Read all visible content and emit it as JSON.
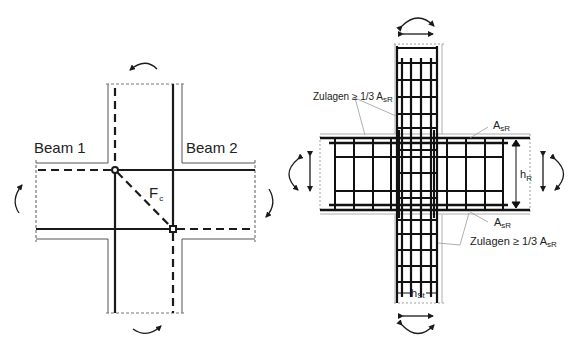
{
  "left_diagram": {
    "beam1_label": "Beam 1",
    "beam2_label": "Beam 2",
    "force_label": "F",
    "force_subscript": "c"
  },
  "right_diagram": {
    "zulagen_top": "Zulagen ≥ 1/3 A",
    "zulagen_top_sub": "sR",
    "asr_top": "A",
    "asr_top_sub": "sR",
    "asr_bottom": "A",
    "asr_bottom_sub": "sR",
    "zulagen_bottom": "Zulagen ≥ 1/3 A",
    "zulagen_bottom_sub": "sR",
    "hr_label": "h",
    "hr_sub": "R",
    "hst_label": "h",
    "hst_sub": "St"
  },
  "colors": {
    "line": "#1a1a1a",
    "thin": "#555555",
    "dashed_outline": "#888888",
    "leader": "#9a9a9a"
  }
}
